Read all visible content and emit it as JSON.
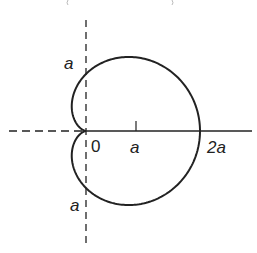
{
  "diagram": {
    "type": "polar-curve",
    "curve": "cardioid r = a(1 + cos θ)",
    "labels": {
      "origin": "0",
      "x_tick_a": "a",
      "x_tick_2a": "2a",
      "y_top": "a",
      "y_bottom": "a"
    },
    "colors": {
      "line": "#222222",
      "background": "#ffffff"
    }
  }
}
